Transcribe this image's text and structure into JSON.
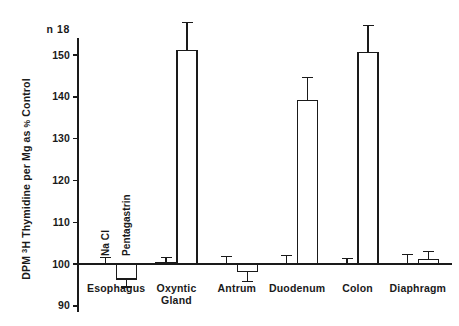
{
  "chart_data": {
    "type": "bar",
    "title": "",
    "subtitle": "",
    "xlabel": "",
    "ylabel": "DPM 3H Thymidine per Mg as % Control",
    "ylabel_parts": {
      "prefix": "DPM ",
      "superscript": "3",
      "middle": "H Thymidine per Mg as ",
      "percent": "%",
      "suffix": " Control"
    },
    "n_annotation": "n  18",
    "n_value": "18",
    "ylim": [
      90,
      158
    ],
    "yticks": [
      90,
      100,
      110,
      120,
      130,
      140,
      150
    ],
    "ytick_labels": [
      "90",
      "100",
      "110",
      "120",
      "130",
      "140",
      "150"
    ],
    "baseline": 100,
    "grid": false,
    "legend_position": "inline-rotated-first-group",
    "categories": [
      "Esophagus",
      "Oxyntic Gland",
      "Antrum",
      "Duodenum",
      "Colon",
      "Diaphragm"
    ],
    "category_labels": [
      [
        "Esophagus"
      ],
      [
        "Oxyntic",
        "Gland"
      ],
      [
        "Antrum"
      ],
      [
        "Duodenum"
      ],
      [
        "Colon"
      ],
      [
        "Diaphragm"
      ]
    ],
    "series": [
      {
        "name": "Na Cl",
        "label": "Na Cl",
        "values": [
          100.0,
          100.3,
          100.0,
          100.2,
          100.2,
          100.0
        ],
        "errors": [
          1.6,
          1.2,
          1.8,
          1.9,
          1.1,
          2.2
        ]
      },
      {
        "name": "Pentagastrin",
        "label": "Pentagastrin",
        "values": [
          96.4,
          151.0,
          98.3,
          139.2,
          150.7,
          101.1
        ],
        "errors": [
          1.9,
          6.8,
          2.5,
          5.5,
          6.3,
          1.8
        ]
      }
    ]
  },
  "figure": {
    "bar_fill_color": "#ffffff",
    "line_color": "#1a1a1a",
    "background_color": "#ffffff"
  }
}
